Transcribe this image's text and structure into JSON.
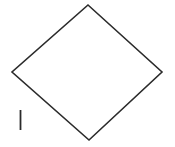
{
  "figure": {
    "canvas": {
      "width": 175,
      "height": 147,
      "background_color": "#ffffff"
    },
    "shapes": [
      {
        "name": "diamond",
        "type": "polygon",
        "closed": true,
        "stroke_color": "#2b2b2b",
        "stroke_width": 1.6,
        "fill_color": "#ffffff",
        "vertices": [
          {
            "label": "top",
            "x": 88,
            "y": 5
          },
          {
            "label": "right",
            "x": 162,
            "y": 72
          },
          {
            "label": "bottom",
            "x": 89,
            "y": 140
          },
          {
            "label": "left",
            "x": 12,
            "y": 72
          }
        ],
        "points_attr": "88,5 162,72 89,140 12,72"
      },
      {
        "name": "side-tick-mark",
        "type": "line",
        "stroke_color": "#2b2b2b",
        "stroke_width": 1.8,
        "x1": 20.5,
        "y1": 110,
        "x2": 20.5,
        "y2": 130
      }
    ],
    "labels": [
      {
        "name": "roman-numeral-one",
        "text": "I",
        "x": 20,
        "y": 120,
        "color": "#2b2b2b",
        "rendered_as": "vertical-stroke"
      }
    ]
  }
}
